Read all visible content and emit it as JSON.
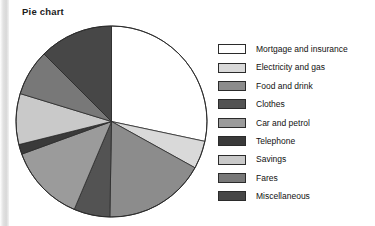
{
  "chart_title": "Pie chart",
  "chart_data": {
    "type": "pie",
    "title": "Pie chart",
    "legend_position": "right",
    "start_angle_deg": 0,
    "direction": "clockwise",
    "categories": [
      "Mortgage and insurance",
      "Electricity and gas",
      "Food and drink",
      "Clothes",
      "Car and petrol",
      "Telephone",
      "Savings",
      "Fares",
      "Miscellaneous"
    ],
    "values": [
      28.3,
      4.7,
      17.2,
      6.1,
      13.1,
      1.7,
      8.6,
      7.8,
      12.5
    ],
    "units": "percent",
    "angles_deg": [
      102,
      17,
      62,
      22,
      47,
      6,
      31,
      28,
      45
    ],
    "colors": [
      "#ffffff",
      "#d9d9d9",
      "#8c8c8c",
      "#535353",
      "#9b9b9b",
      "#3a3a3a",
      "#c9c9c9",
      "#787878",
      "#474747"
    ],
    "slice_outline_color": "#2b2b2b"
  },
  "legend": {
    "items": [
      {
        "label": "Mortgage and insurance",
        "color": "#ffffff"
      },
      {
        "label": "Electricity and gas",
        "color": "#d9d9d9"
      },
      {
        "label": "Food and drink",
        "color": "#8c8c8c"
      },
      {
        "label": "Clothes",
        "color": "#535353"
      },
      {
        "label": "Car and petrol",
        "color": "#9b9b9b"
      },
      {
        "label": "Telephone",
        "color": "#3a3a3a"
      },
      {
        "label": "Savings",
        "color": "#c9c9c9"
      },
      {
        "label": "Fares",
        "color": "#787878"
      },
      {
        "label": "Miscellaneous",
        "color": "#474747"
      }
    ]
  }
}
